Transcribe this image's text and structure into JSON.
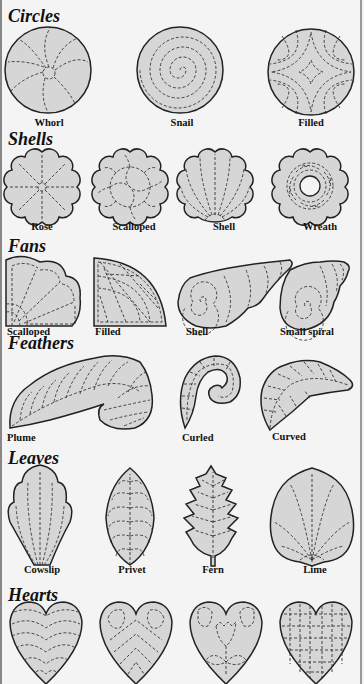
{
  "colors": {
    "background": "#f4f4f4",
    "shape_fill": "#d6d6d6",
    "outline": "#222222",
    "stitch": "#333333"
  },
  "sections": [
    {
      "title": "Circles",
      "items": [
        {
          "label": "Whorl"
        },
        {
          "label": "Snail"
        },
        {
          "label": "Filled"
        }
      ]
    },
    {
      "title": "Shells",
      "items": [
        {
          "label": "Rose"
        },
        {
          "label": "Scalloped"
        },
        {
          "label": "Shell"
        },
        {
          "label": "Wreath"
        }
      ]
    },
    {
      "title": "Fans",
      "items": [
        {
          "label": "Scalloped"
        },
        {
          "label": "Filled"
        },
        {
          "label": "Shell"
        },
        {
          "label": "Small spiral"
        }
      ]
    },
    {
      "title": "Feathers",
      "items": [
        {
          "label": "Plume"
        },
        {
          "label": "Curled"
        },
        {
          "label": "Curved"
        }
      ]
    },
    {
      "title": "Leaves",
      "items": [
        {
          "label": "Cowslip"
        },
        {
          "label": "Privet"
        },
        {
          "label": "Fern"
        },
        {
          "label": "Lime"
        }
      ]
    },
    {
      "title": "Hearts",
      "items": [
        {
          "label": "Horizontal lines"
        },
        {
          "label": "Chevron"
        },
        {
          "label": "Flower"
        },
        {
          "label": "Grid"
        }
      ]
    }
  ]
}
